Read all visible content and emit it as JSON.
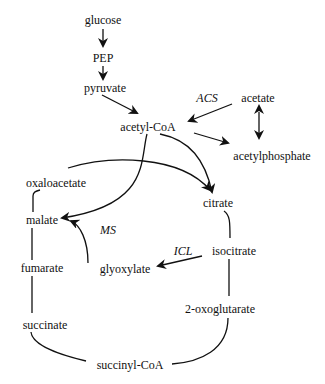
{
  "diagram": {
    "metabolites": {
      "glucose": "glucose",
      "pep": "PEP",
      "pyruvate": "pyruvate",
      "acetate": "acetate",
      "acetyl_coa": "acetyl-CoA",
      "acetylphosphate": "acetylphosphate",
      "oxaloacetate": "oxaloacetate",
      "citrate": "citrate",
      "malate": "malate",
      "isocitrate": "isocitrate",
      "fumarate": "fumarate",
      "glyoxylate": "glyoxylate",
      "oxoglutarate": "2-oxoglutarate",
      "succinate": "succinate",
      "succinyl_coa": "succinyl-CoA"
    },
    "enzymes": {
      "acs": "ACS",
      "ms": "MS",
      "icl": "ICL"
    },
    "stroke_color": "#111111"
  }
}
